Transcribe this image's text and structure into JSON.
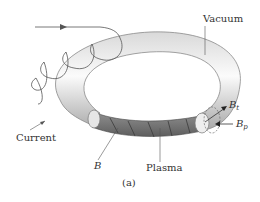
{
  "figure": {
    "caption": "(a)",
    "labels": {
      "vacuum": "Vacuum",
      "current": "Current",
      "field": "B",
      "plasma": "Plasma",
      "bt_main": "B",
      "bt_sub": "t",
      "bp_main": "B",
      "bp_sub": "p"
    },
    "colors": {
      "torus_light": "#f2f2f2",
      "torus_shade": "#b8b8b8",
      "plasma": "#7a7a7a",
      "coil": "#555555",
      "text": "#333333"
    }
  }
}
